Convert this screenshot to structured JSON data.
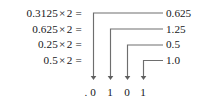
{
  "figure": {
    "stroke_color": "#6e6e6e",
    "text_color": "#17171a",
    "background": "#ffffff"
  },
  "equations": [
    {
      "operand": "0.3125",
      "times": "×",
      "multiplier": "2",
      "equals": "="
    },
    {
      "operand": "0.625",
      "times": "×",
      "multiplier": "2",
      "equals": "="
    },
    {
      "operand": "0.25",
      "times": "×",
      "multiplier": "2",
      "equals": "="
    },
    {
      "operand": "0.5",
      "times": "×",
      "multiplier": "2",
      "equals": "="
    }
  ],
  "results": [
    {
      "value": "0.625"
    },
    {
      "value": "1.25"
    },
    {
      "value": "0.5"
    },
    {
      "value": "1.0"
    }
  ],
  "binary_output": {
    "radix_point": ".",
    "digits": [
      "0",
      "1",
      "0",
      "1"
    ]
  },
  "connectors": [
    {
      "label": "connector-row-1",
      "from_result": "0.625",
      "to_digit_index": 0,
      "arrow_x": 93,
      "row_y": 13
    },
    {
      "label": "connector-row-2",
      "from_result": "1.25",
      "to_digit_index": 1,
      "arrow_x": 110,
      "row_y": 29
    },
    {
      "label": "connector-row-3",
      "from_result": "0.5",
      "to_digit_index": 2,
      "arrow_x": 127,
      "row_y": 45
    },
    {
      "label": "connector-row-4",
      "from_result": "1.0",
      "to_digit_index": 3,
      "arrow_x": 143,
      "row_y": 60
    }
  ]
}
